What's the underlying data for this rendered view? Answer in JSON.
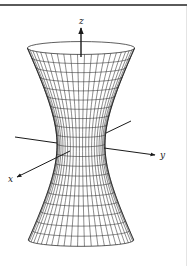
{
  "figure": {
    "axis_labels": {
      "x": "x",
      "y": "y",
      "z": "z"
    },
    "colors": {
      "line": "#1a1a1a",
      "rule": "#5a5a5a",
      "background": "#ffffff"
    }
  },
  "chart_data": {
    "type": "diagram",
    "surface": "hyperboloid of one sheet",
    "center_x": 81,
    "waist_y": 145,
    "waist_half_width": 24,
    "c": 48.5,
    "top_y": 48,
    "bottom_y": 240,
    "ellipse_ratio": 0.12,
    "meridians": 24,
    "parallels": 20,
    "axes": {
      "z": {
        "from": [
          81,
          57
        ],
        "to": [
          81,
          28
        ],
        "label_pos": [
          79,
          24
        ]
      },
      "y_back": {
        "from": [
          15,
          137
        ],
        "to": [
          57,
          143
        ]
      },
      "y_back_right": {
        "from": [
          131,
          121
        ],
        "to": [
          106,
          133
        ]
      },
      "y_front": {
        "from": [
          104,
          148
        ],
        "to": [
          155,
          155
        ],
        "label_pos": [
          160,
          158
        ]
      },
      "x": {
        "from": [
          70,
          151
        ],
        "to": [
          17,
          177
        ],
        "label_pos": [
          8,
          182
        ]
      }
    }
  }
}
